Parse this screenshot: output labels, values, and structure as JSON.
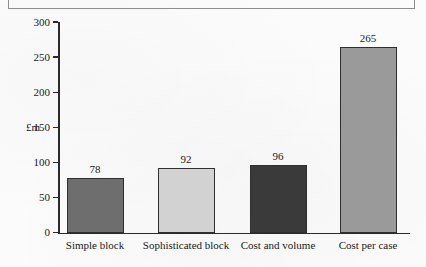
{
  "figure": {
    "title": "FOR DIFFERENT ESTIMATORS",
    "title_note": "clipped-at-top-edge"
  },
  "chart_data": {
    "type": "bar",
    "title": "FOR DIFFERENT ESTIMATORS",
    "xlabel": "",
    "ylabel": "£m",
    "ylim": [
      0,
      300
    ],
    "yticks": [
      0,
      50,
      100,
      150,
      200,
      250,
      300
    ],
    "ytick_labels": [
      "0",
      "50",
      "100",
      "150",
      "200",
      "250",
      "300"
    ],
    "grid": false,
    "legend": "none",
    "categories": [
      "Simple block",
      "Sophisticated block",
      "Cost and volume",
      "Cost per case"
    ],
    "values": [
      78,
      92,
      96,
      265
    ],
    "value_labels": [
      "78",
      "92",
      "96",
      "265"
    ],
    "bar_colors": [
      "#6e6e6e",
      "#d2d2d2",
      "#3a3a3a",
      "#9a9a9a"
    ],
    "bar_edge_color": "#2f2f2f",
    "axis_color": "#2b2b2b"
  }
}
